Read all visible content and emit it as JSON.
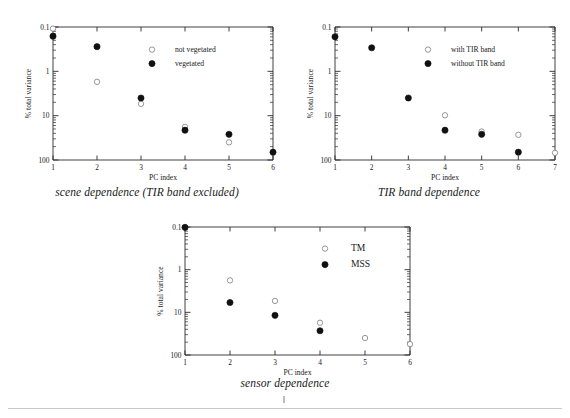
{
  "figure": {
    "y_axis_label": "% total variance",
    "x_axis_label": "PC index",
    "y_tick_labels": [
      "100",
      "10",
      "1",
      "0.1"
    ],
    "y_tick_values": [
      100,
      10,
      1,
      0.1
    ]
  },
  "panels": [
    {
      "id": "scene",
      "caption": "scene dependence (TIR band excluded)",
      "legend": [
        {
          "label": "not vegetated",
          "marker": "open-circle"
        },
        {
          "label": "vegetated",
          "marker": "filled-circle"
        }
      ]
    },
    {
      "id": "tir",
      "caption": "TIR band dependence",
      "legend": [
        {
          "label": "with TIR band",
          "marker": "open-circle"
        },
        {
          "label": "without TIR band",
          "marker": "filled-circle"
        }
      ]
    },
    {
      "id": "sensor",
      "caption": "sensor dependence",
      "legend": [
        {
          "label": "TM",
          "marker": "open-circle"
        },
        {
          "label": "MSS",
          "marker": "filled-circle"
        }
      ]
    }
  ],
  "chart_data": [
    {
      "type": "scatter",
      "id": "scene",
      "title": "scene dependence (TIR band excluded)",
      "xlabel": "PC index",
      "ylabel": "% total variance",
      "yscale": "log",
      "ylim": [
        0.1,
        100
      ],
      "xlim": [
        1,
        6
      ],
      "xticks": [
        1,
        2,
        3,
        4,
        5,
        6
      ],
      "yticks": [
        0.1,
        1,
        10,
        100
      ],
      "grid": false,
      "legend_position": "upper-right",
      "series": [
        {
          "name": "not vegetated",
          "marker": "open-circle",
          "x": [
            1,
            2,
            3,
            4,
            5
          ],
          "values": [
            92,
            5.8,
            1.85,
            0.56,
            0.25
          ]
        },
        {
          "name": "vegetated",
          "marker": "filled-circle",
          "x": [
            1,
            2,
            3,
            4,
            5,
            6
          ],
          "values": [
            62,
            36,
            2.5,
            0.47,
            0.38,
            0.15
          ]
        }
      ]
    },
    {
      "type": "scatter",
      "id": "tir",
      "title": "TIR band dependence",
      "xlabel": "PC index",
      "ylabel": "% total variance",
      "yscale": "log",
      "ylim": [
        0.1,
        100
      ],
      "xlim": [
        1,
        7
      ],
      "xticks": [
        1,
        2,
        3,
        4,
        5,
        6,
        7
      ],
      "yticks": [
        0.1,
        1,
        10,
        100
      ],
      "grid": false,
      "legend_position": "upper-right",
      "series": [
        {
          "name": "with TIR band",
          "marker": "open-circle",
          "x": [
            4,
            5,
            6,
            7
          ],
          "values": [
            1.02,
            0.44,
            0.37,
            0.145
          ]
        },
        {
          "name": "without TIR band",
          "marker": "filled-circle",
          "x": [
            1,
            2,
            3,
            4,
            5,
            6
          ],
          "values": [
            60,
            34,
            2.5,
            0.47,
            0.38,
            0.15
          ]
        }
      ]
    },
    {
      "type": "scatter",
      "id": "sensor",
      "title": "sensor dependence",
      "xlabel": "PC index",
      "ylabel": "% total variance",
      "yscale": "log",
      "ylim": [
        0.1,
        100
      ],
      "xlim": [
        1,
        6
      ],
      "xticks": [
        1,
        2,
        3,
        4,
        5,
        6
      ],
      "yticks": [
        0.1,
        1,
        10,
        100
      ],
      "grid": false,
      "legend_position": "upper-right",
      "series": [
        {
          "name": "TM",
          "marker": "open-circle",
          "x": [
            1,
            2,
            3,
            4,
            5,
            6
          ],
          "values": [
            98,
            5.6,
            1.85,
            0.57,
            0.25,
            0.18
          ]
        },
        {
          "name": "MSS",
          "marker": "filled-circle",
          "x": [
            1,
            2,
            3,
            4
          ],
          "values": [
            98,
            1.7,
            0.85,
            0.37
          ]
        }
      ]
    }
  ]
}
